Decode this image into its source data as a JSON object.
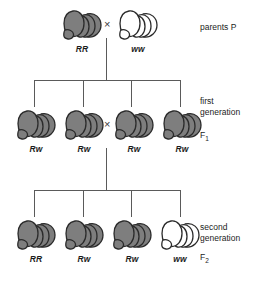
{
  "diagram": {
    "colors": {
      "dominant_fill": "#7e7e7e",
      "dominant_stroke": "#2b2b2b",
      "recessive_fill": "#ffffff",
      "recessive_stroke": "#2b2b2b",
      "line": "#5a5a5a",
      "text": "#1c1c1c"
    },
    "cross_symbol": "×",
    "generations": [
      {
        "key": "parents",
        "side_label_lines": [
          "parents P"
        ],
        "side_label_sub": "",
        "individuals": [
          {
            "genotype": "RR",
            "phenotype": "colored",
            "x": 62,
            "y": 8
          },
          {
            "genotype": "ww",
            "phenotype": "white",
            "x": 110,
            "y": 8
          }
        ],
        "cross_between": [
          0,
          1
        ]
      },
      {
        "key": "f1",
        "side_label_lines": [
          "first",
          "generation"
        ],
        "side_label_sub": "F1",
        "side_label_sub_base": "F",
        "side_label_sub_index": "1",
        "individuals": [
          {
            "genotype": "Rw",
            "phenotype": "colored",
            "x": 16,
            "y": 108
          },
          {
            "genotype": "Rw",
            "phenotype": "colored",
            "x": 64,
            "y": 108
          },
          {
            "genotype": "Rw",
            "phenotype": "colored",
            "x": 112,
            "y": 108
          },
          {
            "genotype": "Rw",
            "phenotype": "colored",
            "x": 160,
            "y": 108
          }
        ],
        "cross_between": [
          1,
          2
        ]
      },
      {
        "key": "f2",
        "side_label_lines": [
          "second",
          "generation"
        ],
        "side_label_sub": "F2",
        "side_label_sub_base": "F",
        "side_label_sub_index": "2",
        "individuals": [
          {
            "genotype": "RR",
            "phenotype": "colored",
            "x": 16,
            "y": 218
          },
          {
            "genotype": "Rw",
            "phenotype": "colored",
            "x": 64,
            "y": 218
          },
          {
            "genotype": "Rw",
            "phenotype": "colored",
            "x": 112,
            "y": 218
          },
          {
            "genotype": "ww",
            "phenotype": "white",
            "x": 160,
            "y": 218
          }
        ],
        "cross_between": null
      }
    ],
    "ratio_note": ""
  },
  "labels": {
    "parents": "parents P",
    "first_line1": "first",
    "first_line2": "generation",
    "f1_base": "F",
    "f1_index": "1",
    "second_line1": "second",
    "second_line2": "generation",
    "f2_base": "F",
    "f2_index": "2"
  },
  "genotypes": {
    "p_left": "RR",
    "p_right": "ww",
    "f1_1": "Rw",
    "f1_2": "Rw",
    "f1_3": "Rw",
    "f1_4": "Rw",
    "f2_1": "RR",
    "f2_2": "Rw",
    "f2_3": "Rw",
    "f2_4": "ww"
  },
  "symbols": {
    "cross_p": "×",
    "cross_f1": "×"
  }
}
